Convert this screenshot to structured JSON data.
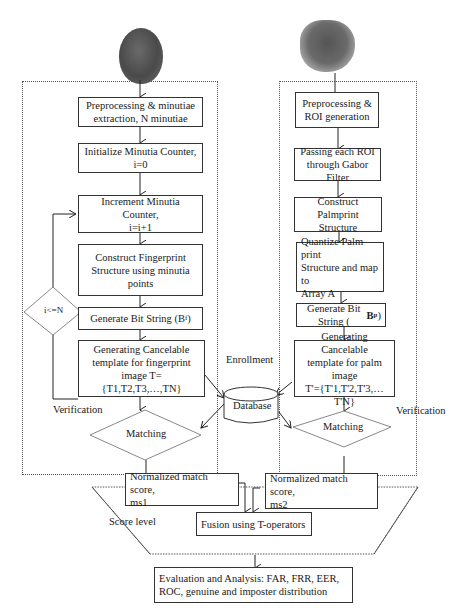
{
  "images": {
    "fingerprint": "fingerprint-image",
    "palmprint": "palmprint-image"
  },
  "fingerprint_branch": {
    "preprocessing": "Preprocessing & minutiae\nextraction, N minutiae",
    "init_counter": "Initialize Minutia Counter,\ni=0",
    "increment_counter": "Increment Minutia Counter,\ni=i+1",
    "construct_structure": "Construct Fingerprint\nStructure using minutia\npoints",
    "bit_string": "Generate Bit String (Bf)",
    "cancelable_template": "Generating Cancelable\ntemplate for fingerprint\nimage T={T1,T2,T3,…,TN}",
    "loop_condition": "i<=N",
    "matching": "Matching",
    "verification_label": "Verification"
  },
  "palmprint_branch": {
    "preprocessing": "Preprocessing &\nROI generation",
    "gabor": "Passing each ROI\nthrough Gabor Filter",
    "construct_structure": "Construct Palmprint\nStructure",
    "quantize": "Quantize Palm print\nStructure and map to\nArray A",
    "bit_string": "Generate Bit String (Bp)",
    "cancelable_template": "Generating Cancelable\ntemplate for palm image\nT'={T'1,T'2,T'3,…T'N}",
    "matching": "Matching",
    "verification_label": "Verification"
  },
  "database": {
    "label": "Database",
    "enrollment_label": "Enrollment"
  },
  "score_level": {
    "label": "Score level",
    "ms1": "Normalized match score,\nms1",
    "ms2": "Normalized match score,\nms2",
    "fusion": "Fusion using T-operators"
  },
  "evaluation": {
    "text": "Evaluation and Analysis: FAR, FRR, EER,\nROC, genuine and imposter distribution"
  }
}
